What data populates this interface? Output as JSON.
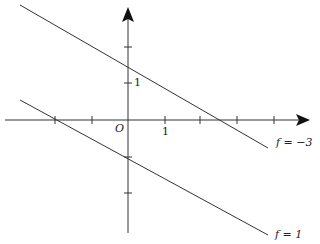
{
  "diagram": {
    "type": "coordinate-plane-level-lines",
    "colors": {
      "line": "#333333",
      "axis": "#222222",
      "background": "#ffffff"
    },
    "axes": {
      "origin_label": "O",
      "x_unit_label": "1",
      "y_unit_label": "1",
      "x_ticks": [
        -2,
        -1,
        1,
        2,
        3,
        4
      ],
      "y_ticks": [
        2,
        1,
        -1,
        -2
      ]
    },
    "lines": [
      {
        "label": "f = −3",
        "x_intercept": 3,
        "y_intercept": 1.5,
        "slope": -0.5
      },
      {
        "label": "f = 1",
        "x_intercept": -2,
        "y_intercept": -1,
        "slope": -0.5
      }
    ]
  }
}
